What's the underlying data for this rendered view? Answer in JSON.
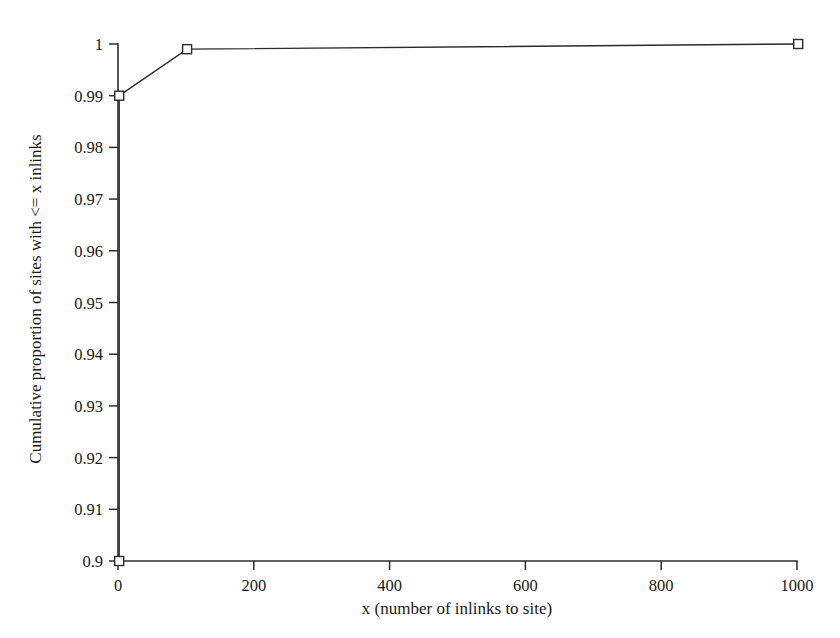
{
  "chart_data": {
    "type": "line",
    "title": "",
    "xlabel": "x (number of inlinks to site)",
    "ylabel": "Cumulative proportion of sites with <= x inlinks",
    "xlim": [
      0,
      1000
    ],
    "ylim": [
      0.9,
      1.0
    ],
    "grid": false,
    "legend": "none",
    "marker": "open-square",
    "line_color": "#2b2b2b",
    "xticks": [
      0,
      200,
      400,
      600,
      800,
      1000
    ],
    "xtick_labels": [
      "0",
      "200",
      "400",
      "600",
      "800",
      "1000"
    ],
    "yticks": [
      0.9,
      0.91,
      0.92,
      0.93,
      0.94,
      0.95,
      0.96,
      0.97,
      0.98,
      0.99,
      1.0
    ],
    "ytick_labels": [
      "0.9",
      "0.91",
      "0.92",
      "0.93",
      "0.94",
      "0.95",
      "0.96",
      "0.97",
      "0.98",
      "0.99",
      "1"
    ],
    "series": [
      {
        "name": "Cumulative proportion",
        "x": [
          0,
          0,
          100,
          1000
        ],
        "values": [
          0.9,
          0.99,
          0.999,
          1.0
        ]
      }
    ]
  }
}
